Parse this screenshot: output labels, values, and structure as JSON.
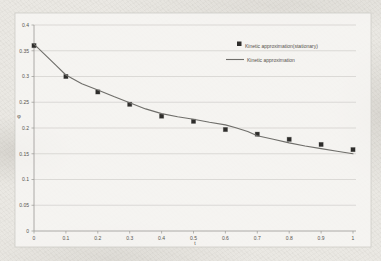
{
  "page": {
    "background_color": "#eae8e3",
    "chart_background_color": "#f7f6f3",
    "frame_border_color": "#cbc9c4"
  },
  "chart_data": {
    "type": "line",
    "title": "",
    "xlabel": "t",
    "ylabel": "φ",
    "xlim": [
      0,
      1
    ],
    "ylim": [
      0,
      0.4
    ],
    "xticks": [
      0,
      0.1,
      0.2,
      0.3,
      0.4,
      0.5,
      0.6,
      0.7,
      0.8,
      0.9,
      1
    ],
    "yticks": [
      0,
      0.05,
      0.1,
      0.15,
      0.2,
      0.25,
      0.3,
      0.35,
      0.4
    ],
    "grid": "horizontal",
    "legend_position": "upper-right-inside",
    "colors": {
      "gridline": "#c9c8c4",
      "axis": "#9a9894",
      "tick_text": "#55524d"
    },
    "series": [
      {
        "name": "Kinetic approximation(stationary)",
        "type": "scatter",
        "marker": "filled-square",
        "color": "#2e2d2b",
        "x": [
          0,
          0.1,
          0.2,
          0.3,
          0.4,
          0.5,
          0.6,
          0.7,
          0.8,
          0.9,
          1
        ],
        "values": [
          0.36,
          0.3,
          0.27,
          0.246,
          0.223,
          0.213,
          0.197,
          0.188,
          0.178,
          0.168,
          0.158
        ]
      },
      {
        "name": "Kinetic approximation",
        "type": "line",
        "color": "#6f6e6a",
        "x": [
          0,
          0.03,
          0.07,
          0.1,
          0.15,
          0.2,
          0.25,
          0.3,
          0.35,
          0.4,
          0.45,
          0.5,
          0.55,
          0.6,
          0.63,
          0.67,
          0.7,
          0.75,
          0.8,
          0.85,
          0.9,
          0.95,
          1
        ],
        "values": [
          0.363,
          0.345,
          0.321,
          0.303,
          0.286,
          0.274,
          0.261,
          0.249,
          0.237,
          0.228,
          0.222,
          0.217,
          0.211,
          0.206,
          0.201,
          0.193,
          0.185,
          0.178,
          0.171,
          0.165,
          0.16,
          0.155,
          0.15
        ]
      }
    ]
  }
}
